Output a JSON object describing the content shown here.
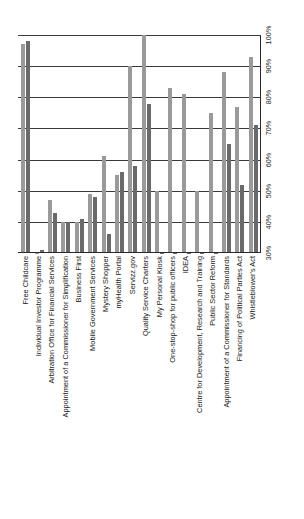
{
  "chart_data": {
    "type": "bar",
    "title": "",
    "xlabel": "",
    "ylabel": "",
    "ylim": [
      30,
      100
    ],
    "grid": true,
    "legend_position": "none",
    "yticks": [
      "30%",
      "40%",
      "50%",
      "60%",
      "70%",
      "80%",
      "90%",
      "100%"
    ],
    "categories": [
      "Free Childcare",
      "Individual Investor Programme",
      "Arbitration Office for Financial Services",
      "Appointment of a Commissioner for Simplification",
      "Business First",
      "Mobile Government Services",
      "Mystery Shopper",
      "myHealth Portal",
      "Servizz.gov",
      "Quality Service Charters",
      "My Personal Kiosk",
      "One-stop-shop for public officers",
      "IDEA",
      "Centre for Development, Research and Training",
      "Public Sector Reform",
      "Appointment of a Commissioner for Standards",
      "Financing of Political Parties Act",
      "Whistleblower's Act"
    ],
    "series": [
      {
        "name": "Series 1",
        "color": "#9a9a9a",
        "values": [
          97,
          30,
          47,
          40,
          40,
          49,
          61,
          55,
          90,
          100,
          50,
          83,
          81,
          50,
          75,
          88,
          77,
          93
        ]
      },
      {
        "name": "Series 2",
        "color": "#6a6a6a",
        "values": [
          98,
          31,
          43,
          40,
          41,
          48,
          36,
          56,
          58,
          78,
          30,
          30,
          30,
          30,
          30,
          65,
          52,
          71
        ]
      }
    ]
  },
  "yaxis": {
    "ticks": [
      "30%",
      "40%",
      "50%",
      "60%",
      "70%",
      "80%",
      "90%",
      "100%"
    ]
  },
  "colors": {
    "series_1": "#9a9a9a",
    "series_2": "#6a6a6a",
    "gridline": "#3a3a3a",
    "axis": "#2a2a2a",
    "background": "#ffffff",
    "text": "#1a1a1a"
  }
}
